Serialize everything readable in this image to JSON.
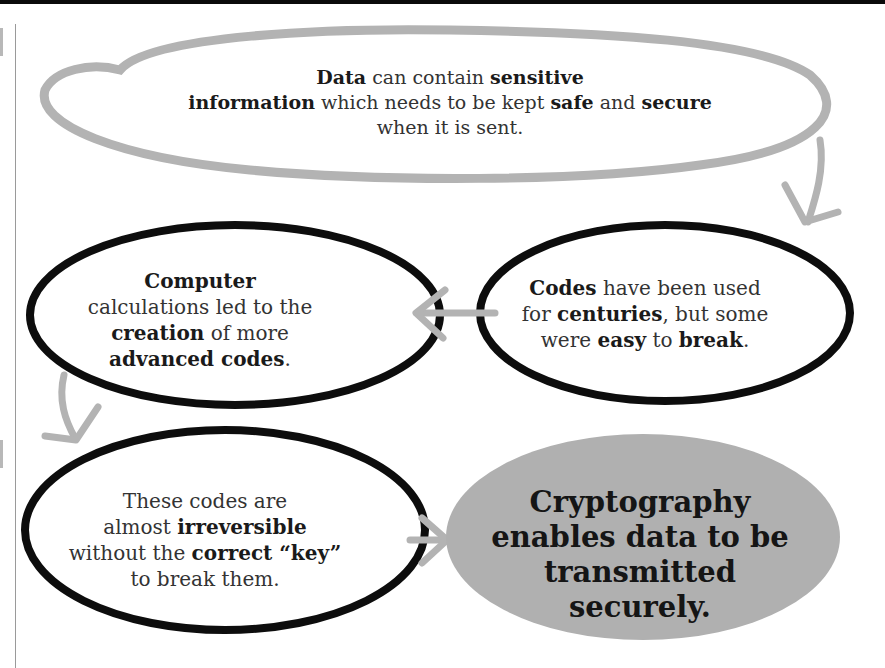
{
  "diagram": {
    "title": "",
    "colors": {
      "grey_stroke": "#b3b3b3",
      "black_stroke": "#0d0d0d",
      "final_fill": "#b0b0b0",
      "text": "#222222"
    },
    "nodes": [
      {
        "id": "data-sensitive",
        "style": "grey-outline-ellipse",
        "lines": [
          [
            {
              "text": "Data",
              "bold": true
            },
            {
              "text": " can contain ",
              "bold": false
            },
            {
              "text": "sensitive",
              "bold": true
            }
          ],
          [
            {
              "text": "information",
              "bold": true
            },
            {
              "text": " which needs to be kept ",
              "bold": false
            },
            {
              "text": "safe",
              "bold": true
            },
            {
              "text": " and ",
              "bold": false
            },
            {
              "text": "secure",
              "bold": true
            }
          ],
          [
            {
              "text": "when it is sent.",
              "bold": false
            }
          ]
        ]
      },
      {
        "id": "codes-centuries",
        "style": "black-outline-ellipse",
        "lines": [
          [
            {
              "text": "Codes",
              "bold": true
            },
            {
              "text": " have been used",
              "bold": false
            }
          ],
          [
            {
              "text": "for ",
              "bold": false
            },
            {
              "text": "centuries",
              "bold": true
            },
            {
              "text": ", but some",
              "bold": false
            }
          ],
          [
            {
              "text": "were ",
              "bold": false
            },
            {
              "text": "easy",
              "bold": true
            },
            {
              "text": " to ",
              "bold": false
            },
            {
              "text": "break",
              "bold": true
            },
            {
              "text": ".",
              "bold": false
            }
          ]
        ]
      },
      {
        "id": "computer-calculations",
        "style": "black-outline-ellipse",
        "lines": [
          [
            {
              "text": "Computer",
              "bold": true
            }
          ],
          [
            {
              "text": "calculations led to the",
              "bold": false
            }
          ],
          [
            {
              "text": "creation",
              "bold": true
            },
            {
              "text": " of more",
              "bold": false
            }
          ],
          [
            {
              "text": "advanced codes",
              "bold": true
            },
            {
              "text": ".",
              "bold": false
            }
          ]
        ]
      },
      {
        "id": "irreversible-codes",
        "style": "black-outline-ellipse",
        "lines": [
          [
            {
              "text": "These codes are",
              "bold": false
            }
          ],
          [
            {
              "text": "almost ",
              "bold": false
            },
            {
              "text": "irreversible",
              "bold": true
            }
          ],
          [
            {
              "text": "without the ",
              "bold": false
            },
            {
              "text": "correct “key”",
              "bold": true
            }
          ],
          [
            {
              "text": "to break them.",
              "bold": false
            }
          ]
        ]
      },
      {
        "id": "cryptography",
        "style": "grey-filled-ellipse",
        "lines": [
          [
            {
              "text": "Cryptography",
              "bold": true
            }
          ],
          [
            {
              "text": "enables data to be",
              "bold": true
            }
          ],
          [
            {
              "text": "transmitted securely.",
              "bold": true
            }
          ]
        ]
      }
    ],
    "edges": [
      {
        "from": "data-sensitive",
        "to": "codes-centuries",
        "icon": "arrow-down-icon"
      },
      {
        "from": "codes-centuries",
        "to": "computer-calculations",
        "icon": "arrow-left-icon"
      },
      {
        "from": "computer-calculations",
        "to": "irreversible-codes",
        "icon": "arrow-down-icon"
      },
      {
        "from": "irreversible-codes",
        "to": "cryptography",
        "icon": "arrow-right-icon"
      }
    ]
  }
}
